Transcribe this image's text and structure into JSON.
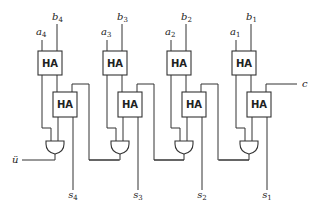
{
  "diagram": {
    "block_label": "HA",
    "carry_in_label": "c",
    "carry_out_label": "ü",
    "stages": [
      {
        "index": 4,
        "a": "a",
        "a_sub": "4",
        "b": "b",
        "b_sub": "4",
        "s": "s",
        "s_sub": "4",
        "ha_top": "HA",
        "ha_bottom": "HA"
      },
      {
        "index": 3,
        "a": "a",
        "a_sub": "3",
        "b": "b",
        "b_sub": "3",
        "s": "s",
        "s_sub": "3",
        "ha_top": "HA",
        "ha_bottom": "HA"
      },
      {
        "index": 2,
        "a": "a",
        "a_sub": "2",
        "b": "b",
        "b_sub": "2",
        "s": "s",
        "s_sub": "2",
        "ha_top": "HA",
        "ha_bottom": "HA"
      },
      {
        "index": 1,
        "a": "a",
        "a_sub": "1",
        "b": "b",
        "b_sub": "1",
        "s": "s",
        "s_sub": "1",
        "ha_top": "HA",
        "ha_bottom": "HA"
      }
    ],
    "gate_type": "OR",
    "colors": {
      "line": "#333333",
      "background": "#ffffff"
    }
  }
}
